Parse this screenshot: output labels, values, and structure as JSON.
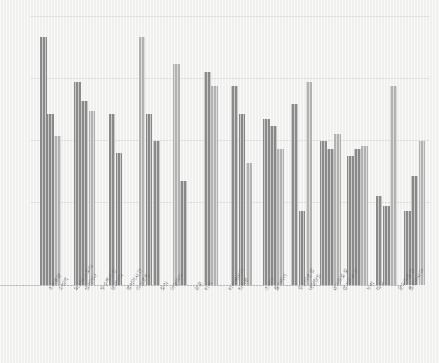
{
  "chart_data": {
    "type": "bar",
    "title": "",
    "subtitle": "",
    "xlabel": "",
    "ylabel": "",
    "ylim": [
      0,
      110
    ],
    "grid": true,
    "gridlines": [
      20,
      40,
      60,
      80,
      100
    ],
    "legend": "none",
    "orientation": "vertical",
    "rotated_labels": true,
    "label_rotation_deg": -57,
    "background_color": "#f3f3f1",
    "gridline_color": "#dedede",
    "axis_color": "#b9b9b9",
    "series_colors": [
      "#8c8c8c",
      "#8a8a8a",
      "#b4b4b4"
    ],
    "categories": [
      "소비총량",
      "소비액",
      "퍼스널스토어",
      "생기거나",
      "부수적수단",
      "생산나이",
      "열의이시간",
      "아스코헐",
      "로이",
      "아열리아",
      "상호",
      "타이",
      "타이베이이",
      "타이완",
      "스위아",
      "률가리아",
      "우스터운장",
      "네덜란드",
      "삼가프로",
      "삼가프로",
      "누락",
      "미국",
      "운두리롤랜",
      "롤로아시아"
    ],
    "bars": [
      {
        "group": 0,
        "series": 0,
        "value": 100,
        "color": "#8c8c8c"
      },
      {
        "group": 0,
        "series": 1,
        "value": 69,
        "color": "#8a8a8a"
      },
      {
        "group": 0,
        "series": 2,
        "value": 60,
        "color": "#b4b4b4"
      },
      {
        "group": 1,
        "series": 0,
        "value": 82,
        "color": "#8c8c8c"
      },
      {
        "group": 1,
        "series": 1,
        "value": 74,
        "color": "#8a8a8a"
      },
      {
        "group": 1,
        "series": 2,
        "value": 70,
        "color": "#b4b4b4"
      },
      {
        "group": 2,
        "series": 0,
        "value": 69,
        "color": "#8c8c8c"
      },
      {
        "group": 2,
        "series": 1,
        "value": 53,
        "color": "#8a8a8a"
      },
      {
        "group": 3,
        "series": 0,
        "value": 100,
        "color": "#b4b4b4"
      },
      {
        "group": 3,
        "series": 1,
        "value": 69,
        "color": "#8a8a8a"
      },
      {
        "group": 3,
        "series": 2,
        "value": 58,
        "color": "#8c8c8c"
      },
      {
        "group": 4,
        "series": 0,
        "value": 89,
        "color": "#b4b4b4"
      },
      {
        "group": 4,
        "series": 1,
        "value": 42,
        "color": "#8a8a8a"
      },
      {
        "group": 5,
        "series": 0,
        "value": 86,
        "color": "#8c8c8c"
      },
      {
        "group": 5,
        "series": 1,
        "value": 80,
        "color": "#b4b4b4"
      },
      {
        "group": 6,
        "series": 0,
        "value": 80,
        "color": "#8c8c8c"
      },
      {
        "group": 6,
        "series": 1,
        "value": 69,
        "color": "#8a8a8a"
      },
      {
        "group": 6,
        "series": 2,
        "value": 49,
        "color": "#b4b4b4"
      },
      {
        "group": 7,
        "series": 0,
        "value": 67,
        "color": "#8c8c8c"
      },
      {
        "group": 7,
        "series": 1,
        "value": 64,
        "color": "#8a8a8a"
      },
      {
        "group": 7,
        "series": 2,
        "value": 55,
        "color": "#b4b4b4"
      },
      {
        "group": 8,
        "series": 0,
        "value": 73,
        "color": "#8c8c8c"
      },
      {
        "group": 8,
        "series": 1,
        "value": 30,
        "color": "#8a8a8a"
      },
      {
        "group": 8,
        "series": 2,
        "value": 82,
        "color": "#b4b4b4"
      },
      {
        "group": 9,
        "series": 0,
        "value": 58,
        "color": "#8c8c8c"
      },
      {
        "group": 9,
        "series": 1,
        "value": 55,
        "color": "#8a8a8a"
      },
      {
        "group": 9,
        "series": 2,
        "value": 61,
        "color": "#b4b4b4"
      },
      {
        "group": 10,
        "series": 0,
        "value": 52,
        "color": "#8c8c8c"
      },
      {
        "group": 10,
        "series": 1,
        "value": 55,
        "color": "#8a8a8a"
      },
      {
        "group": 10,
        "series": 2,
        "value": 56,
        "color": "#b4b4b4"
      },
      {
        "group": 11,
        "series": 0,
        "value": 36,
        "color": "#8c8c8c"
      },
      {
        "group": 11,
        "series": 1,
        "value": 32,
        "color": "#8a8a8a"
      },
      {
        "group": 11,
        "series": 2,
        "value": 80,
        "color": "#b4b4b4"
      },
      {
        "group": 12,
        "series": 0,
        "value": 30,
        "color": "#8c8c8c"
      },
      {
        "group": 12,
        "series": 1,
        "value": 44,
        "color": "#8a8a8a"
      },
      {
        "group": 12,
        "series": 2,
        "value": 58,
        "color": "#b4b4b4"
      }
    ]
  },
  "labels": [
    {
      "text": "소비총량",
      "x": 46
    },
    {
      "text": "소비액",
      "x": 56
    },
    {
      "text": "퍼스널스토어",
      "x": 72
    },
    {
      "text": "생기거나",
      "x": 82
    },
    {
      "text": "부수적수단",
      "x": 98
    },
    {
      "text": "생산나이",
      "x": 108
    },
    {
      "text": "열의이시간",
      "x": 124
    },
    {
      "text": "아스코헐",
      "x": 134
    },
    {
      "text": "로이",
      "x": 158
    },
    {
      "text": "아열리아",
      "x": 168
    },
    {
      "text": "상호",
      "x": 192
    },
    {
      "text": "타이",
      "x": 202
    },
    {
      "text": "타이베이이",
      "x": 226
    },
    {
      "text": "타이완",
      "x": 236
    },
    {
      "text": "스위아",
      "x": 262
    },
    {
      "text": "률가리아",
      "x": 272
    },
    {
      "text": "우스터운장",
      "x": 296
    },
    {
      "text": "네덜란드",
      "x": 306
    },
    {
      "text": "삼가프로로",
      "x": 330
    },
    {
      "text": "삼가프로르",
      "x": 340
    },
    {
      "text": "누락",
      "x": 364
    },
    {
      "text": "미국",
      "x": 374
    },
    {
      "text": "운두리롤랜",
      "x": 396
    },
    {
      "text": "롤로아시아",
      "x": 406
    }
  ]
}
